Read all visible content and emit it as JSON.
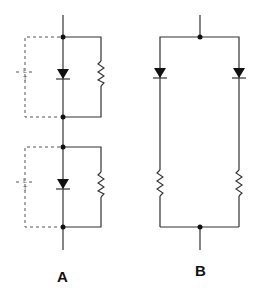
{
  "diagram": {
    "type": "circuit-schematic",
    "panels": [
      {
        "id": "A",
        "label": "A",
        "description": "Two diode stages in series, each diode shunted by a parallel resistor, with dashed enclosure marking",
        "stages": [
          {
            "components": [
              "diode",
              "resistor (parallel)"
            ],
            "dashed_marker": {
              "top": "L",
              "bottom": "T"
            }
          },
          {
            "components": [
              "diode",
              "resistor (parallel)"
            ],
            "dashed_marker": {
              "top": "L",
              "bottom": "T"
            }
          }
        ]
      },
      {
        "id": "B",
        "label": "B",
        "description": "Two parallel branches, each a diode in series with a resistor",
        "branches": [
          {
            "components": [
              "diode",
              "resistor (series)"
            ]
          },
          {
            "components": [
              "diode",
              "resistor (series)"
            ]
          }
        ]
      }
    ]
  },
  "labels": {
    "panel_a": "A",
    "panel_b": "B",
    "marker_top": "L",
    "marker_bottom": "T"
  },
  "colors": {
    "wire": "#333333",
    "background": "#ffffff"
  }
}
